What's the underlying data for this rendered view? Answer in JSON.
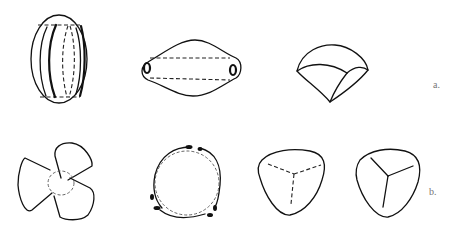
{
  "figure": {
    "rows": [
      {
        "label": "a.",
        "panels": [
          {
            "id": "a1",
            "description": "ellipsoid with longitudinal ribs and dashed inner lines"
          },
          {
            "id": "a2",
            "description": "spindle/lemon shape with pores at both ends and dashed axial lines"
          },
          {
            "id": "a3",
            "description": "fan/kite shaped facet body"
          }
        ]
      },
      {
        "label": "b.",
        "panels": [
          {
            "id": "b1",
            "description": "three-lobed propeller shape with dashed central circle"
          },
          {
            "id": "b2",
            "description": "ring with dashed inner circle and thickened appendage ends"
          },
          {
            "id": "b3",
            "description": "rounded triangle with dashed trilete mark"
          },
          {
            "id": "b4",
            "description": "rounded triangle with solid trilete mark"
          }
        ]
      }
    ]
  },
  "colors": {
    "line": "#111111",
    "label": "#777777",
    "background": "#ffffff"
  }
}
